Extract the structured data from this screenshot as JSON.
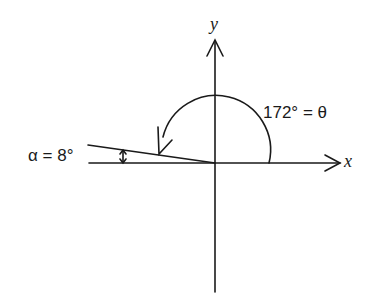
{
  "diagram": {
    "type": "angle-diagram",
    "axes": {
      "x_label": "x",
      "y_label": "y"
    },
    "theta_label": "172° = θ",
    "alpha_label": "α = 8°",
    "theta_degrees": 172,
    "alpha_degrees": 8,
    "line_color": "#1a1a1a"
  }
}
